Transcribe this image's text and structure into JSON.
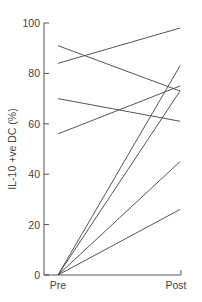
{
  "chart_data": {
    "type": "line",
    "title": "",
    "xlabel": "",
    "ylabel": "IL-10 +ve DC (%)",
    "categories": [
      "Pre",
      "Post"
    ],
    "ylim": [
      0,
      100
    ],
    "yticks": [
      0,
      20,
      40,
      60,
      80,
      100
    ],
    "grid": false,
    "legend": null,
    "series": [
      {
        "name": "subject-1",
        "values": [
          91,
          73
        ]
      },
      {
        "name": "subject-2",
        "values": [
          84,
          98
        ]
      },
      {
        "name": "subject-3",
        "values": [
          70,
          61
        ]
      },
      {
        "name": "subject-4",
        "values": [
          56,
          75
        ]
      },
      {
        "name": "subject-5",
        "values": [
          0,
          83
        ]
      },
      {
        "name": "subject-6",
        "values": [
          0,
          73
        ]
      },
      {
        "name": "subject-7",
        "values": [
          0,
          45
        ]
      },
      {
        "name": "subject-8",
        "values": [
          0,
          26
        ]
      }
    ],
    "line_color": "#555555"
  }
}
